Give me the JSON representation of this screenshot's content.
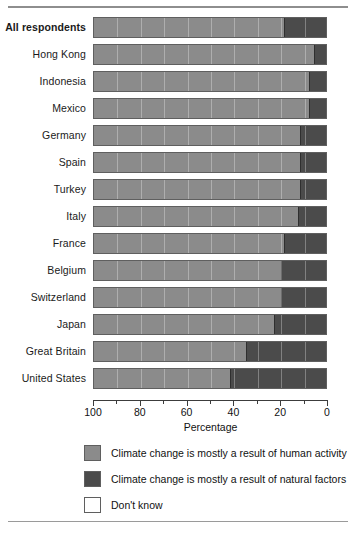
{
  "chart_data": {
    "type": "bar",
    "orientation": "horizontal-stacked",
    "title": "",
    "subtitle": "",
    "xlabel": "Percentage",
    "ylabel": "",
    "xlim": [
      100,
      0
    ],
    "x_axis_reversed": true,
    "xticks": [
      100,
      80,
      60,
      40,
      20,
      0
    ],
    "xticklabels": [
      "100",
      "80",
      "60",
      "40",
      "20",
      "0"
    ],
    "grid": false,
    "legend_position": "bottom",
    "stacked_total": 100,
    "units": "percent",
    "series": [
      {
        "name": "Climate change is mostly a result of human activity",
        "color": "#8b8b8b",
        "values": [
          81,
          94,
          92,
          92,
          88,
          88,
          88,
          87,
          81,
          80,
          80,
          77,
          65,
          58
        ]
      },
      {
        "name": "Climate change is mostly a result of natural factors",
        "color": "#4b4b4b",
        "values": [
          19,
          6,
          8,
          8,
          12,
          12,
          12,
          13,
          19,
          20,
          20,
          23,
          34,
          42
        ]
      },
      {
        "name": "Don't know",
        "color": "#ffffff",
        "values": [
          0,
          0,
          0,
          0,
          0,
          0,
          0,
          0,
          0,
          0,
          0,
          0,
          1,
          0
        ]
      }
    ],
    "categories": [
      "All respondents",
      "Hong Kong",
      "Indonesia",
      "Mexico",
      "Germany",
      "Spain",
      "Turkey",
      "Italy",
      "France",
      "Belgium",
      "Switzerland",
      "Japan",
      "Great Britain",
      "United States"
    ],
    "emphasized_categories": [
      "All respondents"
    ]
  },
  "axis": {
    "title": "Percentage",
    "ticks": [
      {
        "label": "100",
        "value": 100
      },
      {
        "label": "80",
        "value": 80
      },
      {
        "label": "60",
        "value": 60
      },
      {
        "label": "40",
        "value": 40
      },
      {
        "label": "20",
        "value": 20
      },
      {
        "label": "0",
        "value": 0
      }
    ]
  },
  "legend": {
    "items": [
      {
        "label": "Climate change is mostly a result of human activity",
        "swatch": "#8b8b8b"
      },
      {
        "label": "Climate change is mostly a result of natural factors",
        "swatch": "#4b4b4b"
      },
      {
        "label": "Don't know",
        "swatch": "#ffffff"
      }
    ]
  },
  "colors": {
    "human_activity": "#8b8b8b",
    "natural_factors": "#4b4b4b",
    "dont_know": "#ffffff",
    "bar_outline": "#5f5f5f",
    "rule": "#8e8e8e",
    "text": "#111111"
  }
}
